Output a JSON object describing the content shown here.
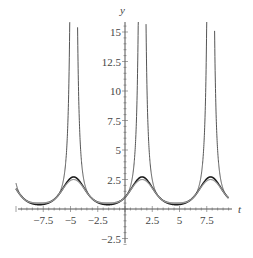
{
  "chart_data": {
    "type": "line",
    "title": "",
    "xlabel": "t",
    "ylabel": "y",
    "xlim": [
      -10.5,
      10.5
    ],
    "ylim": [
      -3.2,
      16.0
    ],
    "x_ticks": [
      -7.5,
      -5,
      -2.5,
      2.5,
      5,
      7.5
    ],
    "x_tick_labels": [
      "−7.5",
      "−5",
      "−2.5",
      "2.5",
      "5",
      "7.5"
    ],
    "y_ticks": [
      -2.5,
      2.5,
      5,
      7.5,
      10,
      12.5,
      15
    ],
    "y_tick_labels": [
      "−2.5",
      "2.5",
      "5",
      "7.5",
      "10",
      "12.5",
      "15"
    ],
    "grid": false,
    "legend": null,
    "x_range_plotted": [
      -10,
      9.5
    ],
    "series": [
      {
        "name": "1/(1 - sin t)",
        "color": "#555555",
        "width": 1.0,
        "description": "diverges near t = π/2 + 2πk; min 0.5 at t = -π/2 + 2πk"
      },
      {
        "name": "exp(sin t)",
        "color": "#1a1a1a",
        "width": 1.6,
        "description": "peak ≈ 2.72 at t ≈ -4.71, 1.57, 7.85; min ≈ 0.37"
      },
      {
        "name": "1 + sin t + sin²t/2",
        "color": "#9a9a9a",
        "width": 1.2,
        "description": "peak 2.5; min 0.5"
      }
    ],
    "sample_points": {
      "t": [
        -7.85,
        -4.71,
        -1.57,
        1.57,
        4.71,
        7.85
      ],
      "exp_sin": [
        0.37,
        2.72,
        0.37,
        2.72,
        0.37,
        2.72
      ],
      "taylor2": [
        0.5,
        2.5,
        0.5,
        2.5,
        0.5,
        2.5
      ]
    }
  }
}
